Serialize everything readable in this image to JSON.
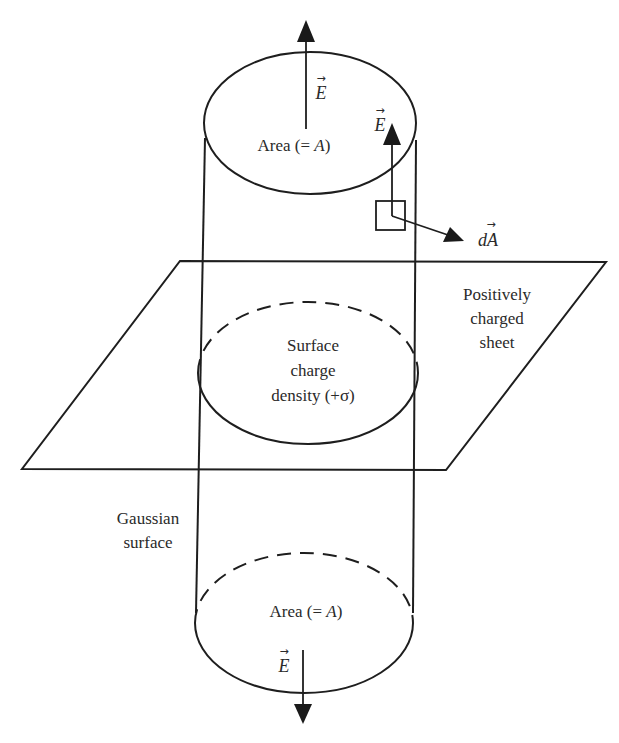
{
  "figure": {
    "type": "Gauss's law applied to an infinite positively charged sheet",
    "colors": {
      "stroke": "#1e1e1e",
      "text": "#2a2a2a",
      "background": "#ffffff"
    }
  },
  "labels": {
    "top_area": {
      "main": "Area (= ",
      "var": "A",
      "close": ")"
    },
    "bottom_area": {
      "main": "Area (= ",
      "var": "A",
      "close": ")"
    },
    "sheet": [
      "Positively",
      "charged",
      "sheet"
    ],
    "surface_charge": [
      "Surface",
      "charge",
      "density (+σ)"
    ],
    "gaussian_surface": [
      "Gaussian",
      "surface"
    ],
    "e_top": "E",
    "e_side": "E",
    "e_bottom": "E",
    "da": "dA",
    "vector_arrow": "→"
  },
  "vectors": [
    {
      "name": "E-top",
      "direction": "up"
    },
    {
      "name": "E-side",
      "direction": "up"
    },
    {
      "name": "dA",
      "direction": "outward-right"
    },
    {
      "name": "E-bottom",
      "direction": "down"
    }
  ]
}
